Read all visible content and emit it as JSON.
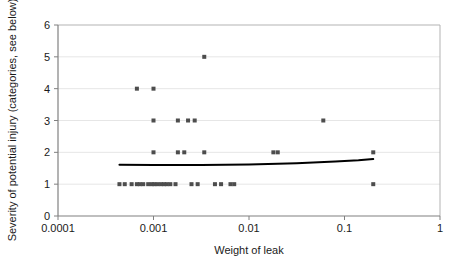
{
  "chart_data": {
    "type": "scatter",
    "title": "",
    "xlabel": "Weight of leak",
    "ylabel": "Severity of potential injury (categories, see below)",
    "xscale": "log",
    "yscale": "linear",
    "xlim": [
      0.0001,
      1
    ],
    "ylim": [
      0,
      6
    ],
    "xticklabels": [
      "0.0001",
      "0.001",
      "0.01",
      "0.1",
      "1"
    ],
    "xtickvalues": [
      0.0001,
      0.001,
      0.01,
      0.1,
      1
    ],
    "yticklabels": [
      "0",
      "1",
      "2",
      "3",
      "4",
      "5",
      "6"
    ],
    "ytickvalues": [
      0,
      1,
      2,
      3,
      4,
      5,
      6
    ],
    "grid": "horizontal",
    "legend": "none",
    "marker": {
      "shape": "square",
      "color": "#4d4d4d",
      "size_px": 4
    },
    "series": [
      {
        "name": "Leak incidents",
        "points": [
          [
            0.00044,
            1
          ],
          [
            0.0005,
            1
          ],
          [
            0.00059,
            1
          ],
          [
            0.00067,
            1
          ],
          [
            0.00072,
            1
          ],
          [
            0.00078,
            1
          ],
          [
            0.00088,
            1
          ],
          [
            0.00096,
            1
          ],
          [
            0.00102,
            1
          ],
          [
            0.0011,
            1
          ],
          [
            0.0012,
            1
          ],
          [
            0.00129,
            1
          ],
          [
            0.00138,
            1
          ],
          [
            0.0015,
            1
          ],
          [
            0.0017,
            1
          ],
          [
            0.0025,
            1
          ],
          [
            0.0029,
            1
          ],
          [
            0.0044,
            1
          ],
          [
            0.0051,
            1
          ],
          [
            0.0064,
            1
          ],
          [
            0.007,
            1
          ],
          [
            0.2,
            1
          ],
          [
            0.001,
            2
          ],
          [
            0.0018,
            2
          ],
          [
            0.0021,
            2
          ],
          [
            0.0034,
            2
          ],
          [
            0.018,
            2
          ],
          [
            0.02,
            2
          ],
          [
            0.2,
            2
          ],
          [
            0.001,
            3
          ],
          [
            0.0018,
            3
          ],
          [
            0.0023,
            3
          ],
          [
            0.0027,
            3
          ],
          [
            0.06,
            3
          ],
          [
            0.00067,
            4
          ],
          [
            0.001,
            4
          ],
          [
            0.0034,
            5
          ]
        ]
      }
    ],
    "trendline": {
      "name": "Fitted trend",
      "color": "#000000",
      "width_px": 2,
      "points": [
        [
          0.00044,
          1.61
        ],
        [
          0.001,
          1.6
        ],
        [
          0.00316,
          1.6
        ],
        [
          0.01,
          1.62
        ],
        [
          0.0316,
          1.66
        ],
        [
          0.08,
          1.71
        ],
        [
          0.14,
          1.75
        ],
        [
          0.2,
          1.79
        ]
      ]
    }
  }
}
